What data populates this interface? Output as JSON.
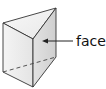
{
  "diagram": {
    "label": "face",
    "colors": {
      "edge": "#333333",
      "top_face": "#f2f2f2",
      "left_face": "#ececec",
      "right_face": "#d8d8d8",
      "arrow": "#222222",
      "text": "#111111"
    }
  }
}
